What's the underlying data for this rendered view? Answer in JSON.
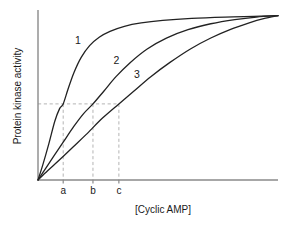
{
  "figure": {
    "background_color": "#ffffff",
    "curve_color": "#222222",
    "axis_color": "#8a8a8a",
    "guide_color": "#b4b4b4"
  },
  "chart_data": {
    "type": "line",
    "title": "",
    "subtitle": "",
    "xlabel": "[Cyclic AMP]",
    "ylabel": "Protein kinase activity",
    "grid": false,
    "legend_position": "inline-curve-labels",
    "xlim": [
      0,
      1
    ],
    "ylim": [
      0,
      1
    ],
    "x_tick_labels": [
      "a",
      "b",
      "c"
    ],
    "x_tick_values": [
      0.105,
      0.229,
      0.337
    ],
    "y_tick_labels": [],
    "annotations": [
      {
        "name": "curve-label-1",
        "text": "1",
        "x": 0.154,
        "y": 0.809
      },
      {
        "name": "curve-label-2",
        "text": "2",
        "x": 0.315,
        "y": 0.69
      },
      {
        "name": "curve-label-3",
        "text": "3",
        "x": 0.4,
        "y": 0.61
      }
    ],
    "guides": {
      "horizontal_level": 0.453,
      "vertical_at": [
        "a",
        "b",
        "c"
      ]
    },
    "series": [
      {
        "name": "1",
        "label": "1",
        "description": "steepest sigmoidal rise, plateaus earliest",
        "x": [
          0.0,
          0.02,
          0.045,
          0.07,
          0.09,
          0.105,
          0.125,
          0.15,
          0.18,
          0.215,
          0.255,
          0.3,
          0.36,
          0.43,
          0.52,
          0.64,
          0.78,
          0.9,
          1.0
        ],
        "y": [
          0.0,
          0.09,
          0.215,
          0.35,
          0.425,
          0.453,
          0.54,
          0.64,
          0.73,
          0.8,
          0.85,
          0.885,
          0.915,
          0.935,
          0.95,
          0.962,
          0.97,
          0.974,
          0.978
        ]
      },
      {
        "name": "2",
        "label": "2",
        "description": "intermediate rise, half-maximal at b",
        "x": [
          0.0,
          0.03,
          0.065,
          0.105,
          0.15,
          0.19,
          0.229,
          0.275,
          0.325,
          0.385,
          0.455,
          0.535,
          0.625,
          0.72,
          0.82,
          0.91,
          1.0
        ],
        "y": [
          0.0,
          0.065,
          0.14,
          0.225,
          0.32,
          0.395,
          0.453,
          0.53,
          0.615,
          0.7,
          0.78,
          0.845,
          0.895,
          0.93,
          0.955,
          0.97,
          0.978
        ]
      },
      {
        "name": "3",
        "label": "3",
        "description": "shallowest rise, half-maximal at c",
        "x": [
          0.0,
          0.04,
          0.09,
          0.145,
          0.2,
          0.27,
          0.337,
          0.4,
          0.47,
          0.55,
          0.635,
          0.72,
          0.8,
          0.88,
          0.94,
          1.0
        ],
        "y": [
          0.0,
          0.055,
          0.12,
          0.195,
          0.27,
          0.37,
          0.453,
          0.53,
          0.615,
          0.7,
          0.78,
          0.845,
          0.895,
          0.935,
          0.96,
          0.978
        ]
      }
    ]
  }
}
